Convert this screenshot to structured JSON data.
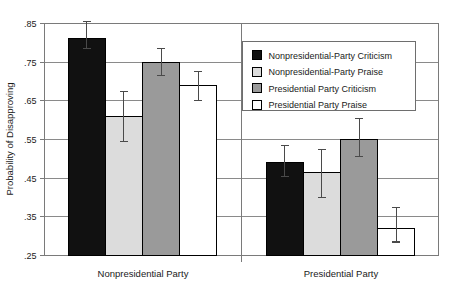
{
  "chart_data": {
    "type": "bar",
    "title": "",
    "xlabel": "",
    "ylabel": "Probability of Disapproving",
    "ylim": [
      0.25,
      0.85
    ],
    "yticks": [
      0.85,
      0.75,
      0.65,
      0.55,
      0.45,
      0.35,
      0.25
    ],
    "ytick_labels": [
      ".85",
      ".75",
      ".65",
      ".55",
      ".45",
      ".35",
      ".25"
    ],
    "grid": true,
    "legend_position": "upper right",
    "categories": [
      "Nonpresidential Party",
      "Presidential Party"
    ],
    "series": [
      {
        "name": "Nonpresidential-Party Criticism",
        "swatch": "#111111",
        "fill": "#111111",
        "stroke": "#000000",
        "values": [
          0.81,
          0.49
        ],
        "err_low": [
          0.785,
          0.455
        ],
        "err_high": [
          0.855,
          0.535
        ]
      },
      {
        "name": "Nonpresidential-Party Praise",
        "swatch": "#dcdcdc",
        "fill": "#dcdcdc",
        "stroke": "#000000",
        "values": [
          0.61,
          0.465
        ],
        "err_low": [
          0.545,
          0.4
        ],
        "err_high": [
          0.675,
          0.525
        ]
      },
      {
        "name": "Presidential Party Criticism",
        "swatch": "#9a9a9a",
        "fill": "#9a9a9a",
        "stroke": "#000000",
        "values": [
          0.75,
          0.55
        ],
        "err_low": [
          0.715,
          0.505
        ],
        "err_high": [
          0.785,
          0.605
        ]
      },
      {
        "name": "Presidential Party Praise",
        "swatch": "#ffffff",
        "fill": "#ffffff",
        "stroke": "#000000",
        "values": [
          0.69,
          0.32
        ],
        "err_low": [
          0.65,
          0.285
        ],
        "err_high": [
          0.725,
          0.375
        ]
      }
    ]
  },
  "axis": {
    "ylabel": "Probability of Disapproving",
    "ytick_labels": [
      ".85",
      ".75",
      ".65",
      ".55",
      ".45",
      ".35",
      ".25"
    ],
    "category_labels": [
      "Nonpresidential Party",
      "Presidential Party"
    ]
  },
  "legend": {
    "items": [
      {
        "label": "Nonpresidential-Party Criticism",
        "swatch": "#111111"
      },
      {
        "label": "Nonpresidential-Party Praise",
        "swatch": "#dcdcdc"
      },
      {
        "label": "Presidential Party Criticism",
        "swatch": "#9a9a9a"
      },
      {
        "label": "Presidential Party Praise",
        "swatch": "#ffffff"
      }
    ]
  },
  "colors": {
    "frame": "#7a7a7a",
    "grid": "#8a8a8a",
    "text": "#1a1a1a",
    "background": "#ffffff"
  }
}
